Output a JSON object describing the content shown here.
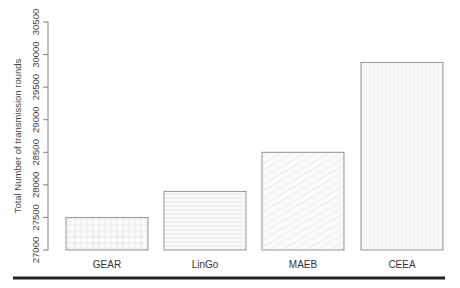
{
  "chart_data": {
    "type": "bar",
    "title": "",
    "xlabel": "",
    "ylabel": "Total Number of transmission rounds",
    "categories": [
      "GEAR",
      "LinGo",
      "MAEB",
      "CEEA"
    ],
    "values": [
      27500,
      27900,
      28500,
      29880
    ],
    "ylim": [
      27000,
      30500
    ],
    "yticks": [
      27000,
      27500,
      28000,
      28500,
      29000,
      29500,
      30000,
      30500
    ],
    "grid": false,
    "legend": null,
    "bar_patterns": [
      "crosshatch",
      "horizontal",
      "diagonal",
      "vertical"
    ],
    "colors": {
      "bar_fill": "#fafafa",
      "bar_pattern": "#dcdcdc",
      "bar_border": "#8a8a8a",
      "axis": "#666666",
      "baseline": "#222222"
    }
  }
}
